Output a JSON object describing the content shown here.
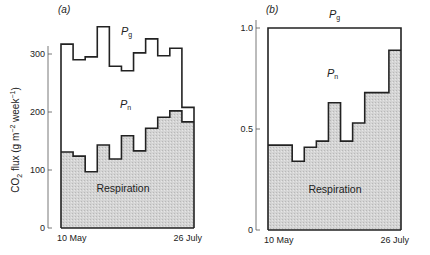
{
  "figure": {
    "ylabel_prefix": "CO",
    "ylabel_sub": "2",
    "ylabel_main": " flux (g m",
    "ylabel_sup1": "−2",
    "ylabel_mid": " week",
    "ylabel_sup2": "−1",
    "ylabel_end": ")"
  },
  "panels": [
    {
      "id": "a",
      "label": "(a)",
      "pg_label": "P",
      "pg_sub": "g",
      "pn_label": "P",
      "pn_sub": "n",
      "resp_label": "Respiration",
      "x_start": "10 May",
      "x_end": "26 July",
      "y_ticks": [
        "0",
        "100",
        "200",
        "300"
      ]
    },
    {
      "id": "b",
      "label": "(b)",
      "pg_label": "P",
      "pg_sub": "g",
      "pn_label": "P",
      "pn_sub": "n",
      "resp_label": "Respiration",
      "x_start": "10 May",
      "x_end": "26 July",
      "y_ticks": [
        "0",
        "0.5",
        "1.0"
      ]
    }
  ],
  "chart_data": [
    {
      "type": "area",
      "title": "(a)",
      "subtitle": "Weekly CO2 flux: gross production (Pg), net production (Pn) and respiration",
      "xlabel": "",
      "ylabel": "CO2 flux (g m−2 week−1)",
      "x_range": [
        "10 May",
        "26 July"
      ],
      "ylim": [
        0,
        350
      ],
      "y_ticks": [
        0,
        100,
        200,
        300
      ],
      "grid": false,
      "legend": "inline labels (Pg, Pn, Respiration)",
      "step": true,
      "categories": [
        "wk1",
        "wk2",
        "wk3",
        "wk4",
        "wk5",
        "wk6",
        "wk7",
        "wk8",
        "wk9",
        "wk10",
        "wk11"
      ],
      "series": [
        {
          "name": "Pg (gross production)",
          "values": [
            317,
            290,
            295,
            347,
            279,
            271,
            302,
            326,
            297,
            310,
            208
          ]
        },
        {
          "name": "Respiration",
          "values": [
            131,
            124,
            97,
            143,
            119,
            159,
            133,
            172,
            191,
            202,
            183
          ]
        }
      ],
      "annotations": [
        "Pg",
        "Pn",
        "Respiration"
      ]
    },
    {
      "type": "area",
      "title": "(b)",
      "subtitle": "Respiration as a fraction of gross production (Pg = 1.0)",
      "xlabel": "",
      "ylabel": "fraction of Pg",
      "x_range": [
        "10 May",
        "26 July"
      ],
      "ylim": [
        0,
        1.0
      ],
      "y_ticks": [
        0,
        0.5,
        1.0
      ],
      "grid": false,
      "legend": "inline labels (Pg, Pn, Respiration)",
      "step": true,
      "categories": [
        "wk1",
        "wk2",
        "wk3",
        "wk4",
        "wk5",
        "wk6",
        "wk7",
        "wk8",
        "wk9",
        "wk10",
        "wk11"
      ],
      "series": [
        {
          "name": "Pg (gross production)",
          "values": [
            1.0,
            1.0,
            1.0,
            1.0,
            1.0,
            1.0,
            1.0,
            1.0,
            1.0,
            1.0,
            1.0
          ]
        },
        {
          "name": "Respiration",
          "values": [
            0.42,
            0.42,
            0.34,
            0.41,
            0.44,
            0.63,
            0.44,
            0.53,
            0.68,
            0.68,
            0.89
          ]
        }
      ],
      "annotations": [
        "Pg",
        "Pn",
        "Respiration"
      ]
    }
  ]
}
